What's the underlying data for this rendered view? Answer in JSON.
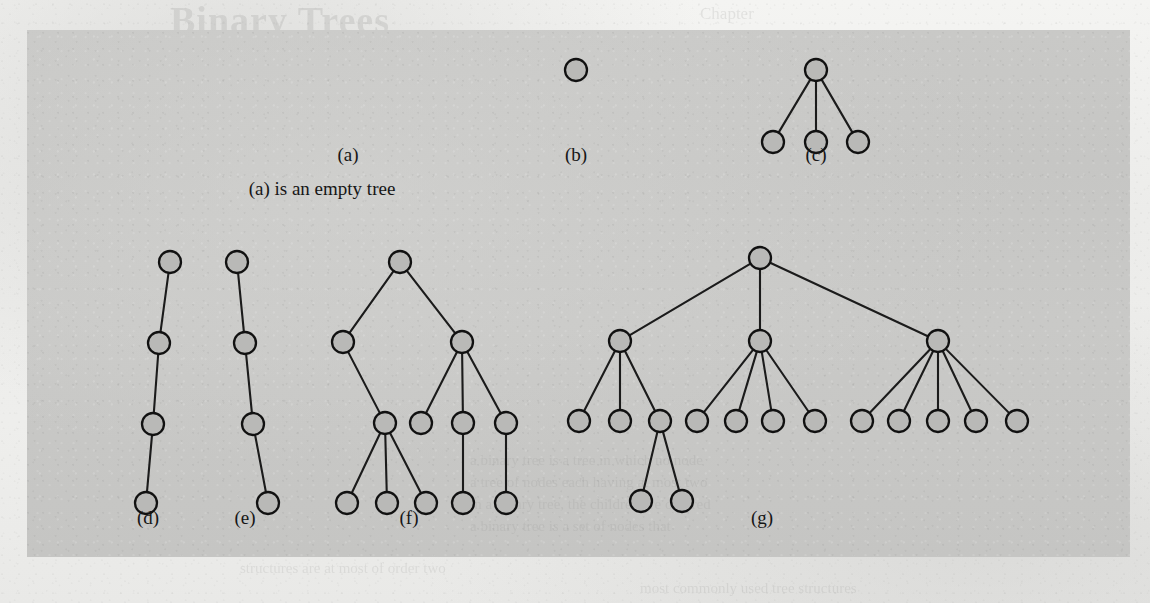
{
  "figure": {
    "plate": {
      "left": 27,
      "top": 30,
      "width": 1103,
      "height": 527,
      "fill": "#c7c7c5"
    },
    "node_fill": "#b9b9b7",
    "node_stroke": "#111111",
    "edge_stroke": "#1b1b1b",
    "node_radius": 11,
    "caption": "(a) is an empty tree",
    "caption_x": 322,
    "caption_y": 189,
    "labels": [
      {
        "id": "a",
        "text": "(a)",
        "x": 348,
        "y": 155
      },
      {
        "id": "b",
        "text": "(b)",
        "x": 576,
        "y": 155
      },
      {
        "id": "c",
        "text": "(c)",
        "x": 816,
        "y": 155
      },
      {
        "id": "d",
        "text": "(d)",
        "x": 148,
        "y": 518
      },
      {
        "id": "e",
        "text": "(e)",
        "x": 245,
        "y": 518
      },
      {
        "id": "f",
        "text": "(f)",
        "x": 409,
        "y": 518
      },
      {
        "id": "g",
        "text": "(g)",
        "x": 762,
        "y": 518
      }
    ],
    "trees": [
      {
        "id": "a",
        "name": "empty-tree",
        "node_count": 0,
        "description": "empty tree - no nodes",
        "nodes": [],
        "edges": []
      },
      {
        "id": "b",
        "name": "single-node-tree",
        "node_count": 1,
        "description": "a single root node",
        "nodes": [
          {
            "id": "b0",
            "x": 576,
            "y": 70
          }
        ],
        "edges": []
      },
      {
        "id": "c",
        "name": "root-with-three-children",
        "node_count": 4,
        "description": "root with three leaf children",
        "nodes": [
          {
            "id": "c0",
            "x": 816,
            "y": 70
          },
          {
            "id": "c1",
            "x": 773,
            "y": 142
          },
          {
            "id": "c2",
            "x": 816,
            "y": 142
          },
          {
            "id": "c3",
            "x": 858,
            "y": 142
          }
        ],
        "edges": [
          [
            "c0",
            "c1"
          ],
          [
            "c0",
            "c2"
          ],
          [
            "c0",
            "c3"
          ]
        ]
      },
      {
        "id": "d",
        "name": "left-leaning-chain",
        "node_count": 4,
        "description": "linear chain of four nodes leaning left",
        "nodes": [
          {
            "id": "d0",
            "x": 170,
            "y": 262
          },
          {
            "id": "d1",
            "x": 159,
            "y": 343
          },
          {
            "id": "d2",
            "x": 153,
            "y": 424
          },
          {
            "id": "d3",
            "x": 146,
            "y": 503
          }
        ],
        "edges": [
          [
            "d0",
            "d1"
          ],
          [
            "d1",
            "d2"
          ],
          [
            "d2",
            "d3"
          ]
        ]
      },
      {
        "id": "e",
        "name": "right-leaning-chain",
        "node_count": 4,
        "description": "linear chain of four nodes leaning right",
        "nodes": [
          {
            "id": "e0",
            "x": 237,
            "y": 262
          },
          {
            "id": "e1",
            "x": 245,
            "y": 343
          },
          {
            "id": "e2",
            "x": 253,
            "y": 424
          },
          {
            "id": "e3",
            "x": 268,
            "y": 503
          }
        ],
        "edges": [
          [
            "e0",
            "e1"
          ],
          [
            "e1",
            "e2"
          ],
          [
            "e2",
            "e3"
          ]
        ]
      },
      {
        "id": "f",
        "name": "mixed-arity-tree",
        "node_count": 11,
        "description": "root with two children; left child has one child with three leaves; right child has three children, two of which have one leaf each",
        "nodes": [
          {
            "id": "f0",
            "x": 400,
            "y": 262
          },
          {
            "id": "f1",
            "x": 343,
            "y": 342
          },
          {
            "id": "f2",
            "x": 462,
            "y": 342
          },
          {
            "id": "f3",
            "x": 385,
            "y": 423
          },
          {
            "id": "f4",
            "x": 421,
            "y": 423
          },
          {
            "id": "f5",
            "x": 463,
            "y": 423
          },
          {
            "id": "f6",
            "x": 506,
            "y": 423
          },
          {
            "id": "f7",
            "x": 347,
            "y": 503
          },
          {
            "id": "f8",
            "x": 387,
            "y": 503
          },
          {
            "id": "f9",
            "x": 426,
            "y": 503
          },
          {
            "id": "f10",
            "x": 463,
            "y": 503
          },
          {
            "id": "f11",
            "x": 506,
            "y": 503
          }
        ],
        "edges": [
          [
            "f0",
            "f1"
          ],
          [
            "f0",
            "f2"
          ],
          [
            "f1",
            "f3"
          ],
          [
            "f2",
            "f4"
          ],
          [
            "f2",
            "f5"
          ],
          [
            "f2",
            "f6"
          ],
          [
            "f3",
            "f7"
          ],
          [
            "f3",
            "f8"
          ],
          [
            "f3",
            "f9"
          ],
          [
            "f5",
            "f10"
          ],
          [
            "f6",
            "f11"
          ]
        ]
      },
      {
        "id": "g",
        "name": "wide-three-subtree-tree",
        "node_count": 18,
        "description": "root with three children; left child has three children (the third has two children); middle child has four children; right child has five children",
        "nodes": [
          {
            "id": "g0",
            "x": 760,
            "y": 258
          },
          {
            "id": "g1",
            "x": 620,
            "y": 341
          },
          {
            "id": "g2",
            "x": 760,
            "y": 341
          },
          {
            "id": "g3",
            "x": 938,
            "y": 341
          },
          {
            "id": "g4",
            "x": 579,
            "y": 421
          },
          {
            "id": "g5",
            "x": 620,
            "y": 421
          },
          {
            "id": "g6",
            "x": 660,
            "y": 421
          },
          {
            "id": "g7",
            "x": 697,
            "y": 421
          },
          {
            "id": "g8",
            "x": 736,
            "y": 421
          },
          {
            "id": "g9",
            "x": 773,
            "y": 421
          },
          {
            "id": "g10",
            "x": 815,
            "y": 421
          },
          {
            "id": "g11",
            "x": 862,
            "y": 421
          },
          {
            "id": "g12",
            "x": 899,
            "y": 421
          },
          {
            "id": "g13",
            "x": 938,
            "y": 421
          },
          {
            "id": "g14",
            "x": 976,
            "y": 421
          },
          {
            "id": "g15",
            "x": 1017,
            "y": 421
          },
          {
            "id": "g16",
            "x": 641,
            "y": 501
          },
          {
            "id": "g17",
            "x": 682,
            "y": 501
          }
        ],
        "edges": [
          [
            "g0",
            "g1"
          ],
          [
            "g0",
            "g2"
          ],
          [
            "g0",
            "g3"
          ],
          [
            "g1",
            "g4"
          ],
          [
            "g1",
            "g5"
          ],
          [
            "g1",
            "g6"
          ],
          [
            "g2",
            "g7"
          ],
          [
            "g2",
            "g8"
          ],
          [
            "g2",
            "g9"
          ],
          [
            "g2",
            "g10"
          ],
          [
            "g3",
            "g11"
          ],
          [
            "g3",
            "g12"
          ],
          [
            "g3",
            "g13"
          ],
          [
            "g3",
            "g14"
          ],
          [
            "g3",
            "g15"
          ],
          [
            "g6",
            "g16"
          ],
          [
            "g6",
            "g17"
          ]
        ]
      }
    ]
  },
  "bleed_through": {
    "heading": "Binary Trees",
    "subheading": "Chapter",
    "lines": [
      {
        "text": "a binary tree is a tree in which no node",
        "x": 470,
        "y": 462
      },
      {
        "text": "a tree of nodes each having at most two",
        "x": 470,
        "y": 484
      },
      {
        "text": "in a binary tree, the children are ordered",
        "x": 470,
        "y": 506
      },
      {
        "text": "a binary tree is a set of nodes that",
        "x": 470,
        "y": 528
      },
      {
        "text": "structures are at most of order two",
        "x": 240,
        "y": 566
      },
      {
        "text": "most commonly used tree structures",
        "x": 640,
        "y": 586
      }
    ]
  }
}
